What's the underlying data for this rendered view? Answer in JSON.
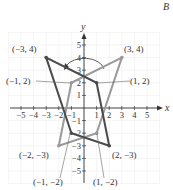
{
  "corner_label": "B",
  "chart_data": {
    "type": "diagram",
    "title": "",
    "xlabel": "x",
    "ylabel": "y",
    "xlim": [
      -5,
      5
    ],
    "ylim": [
      -5,
      5
    ],
    "x_ticks": [
      "-5",
      "-4",
      "-3",
      "-2",
      "-1",
      "1",
      "2",
      "3",
      "4",
      "5"
    ],
    "y_ticks": [
      "5",
      "4",
      "3",
      "2",
      "1",
      "-1",
      "-2",
      "-3",
      "-4",
      "-5"
    ],
    "grid": true,
    "rotation_arrow": "curved arrow above origin near y=4, counterclockwise from right to left",
    "series": [
      {
        "name": "dark-quadrilateral",
        "color": "#4a4a4a",
        "points": [
          [
            -3,
            4
          ],
          [
            1,
            2
          ],
          [
            2,
            -3
          ],
          [
            -1,
            -2
          ]
        ]
      },
      {
        "name": "light-quadrilateral",
        "color": "#9a9a9a",
        "points": [
          [
            3,
            4
          ],
          [
            -1,
            2
          ],
          [
            -2,
            -3
          ],
          [
            1,
            -2
          ]
        ]
      }
    ],
    "point_labels": [
      {
        "text": "(−3, 4)",
        "x": -3,
        "y": 4
      },
      {
        "text": "(3, 4)",
        "x": 3,
        "y": 4
      },
      {
        "text": "(−1, 2)",
        "x": -1,
        "y": 2
      },
      {
        "text": "(1, 2)",
        "x": 1,
        "y": 2
      },
      {
        "text": "(−2, −3)",
        "x": -2,
        "y": -3
      },
      {
        "text": "(2, −3)",
        "x": 2,
        "y": -3
      },
      {
        "text": "(−1, −2)",
        "x": -1,
        "y": -2
      },
      {
        "text": "(1, −2)",
        "x": 1,
        "y": -2
      }
    ]
  }
}
